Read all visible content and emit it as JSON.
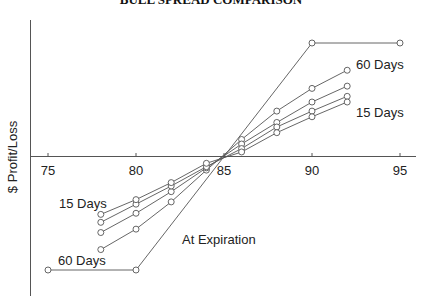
{
  "chart_data": {
    "type": "line",
    "title": "BULL SPREAD COMPARISON",
    "xlabel": "",
    "ylabel": "$ Profit/Loss",
    "xlim": [
      75,
      96
    ],
    "ylim": [
      -5.4,
      5.7
    ],
    "x_ticks": [
      75,
      80,
      85,
      90,
      95
    ],
    "y_ticks": [],
    "grid": false,
    "legend": "none (inline annotations)",
    "series": [
      {
        "name": "At Expiration",
        "x": [
          75,
          80,
          90,
          95
        ],
        "values": [
          -5,
          -5,
          5,
          5
        ]
      },
      {
        "name": "60 Days",
        "x": [
          78,
          80,
          82,
          84,
          86,
          88,
          90,
          92
        ],
        "values": [
          -4.1,
          -3.2,
          -2.0,
          -0.6,
          0.75,
          2.0,
          3.0,
          3.8
        ]
      },
      {
        "name": "",
        "x": [
          78,
          80,
          82,
          84,
          86,
          88,
          90,
          92
        ],
        "values": [
          -3.35,
          -2.5,
          -1.55,
          -0.5,
          0.55,
          1.5,
          2.4,
          3.1
        ]
      },
      {
        "name": "",
        "x": [
          78,
          80,
          82,
          84,
          86,
          88,
          90,
          92
        ],
        "values": [
          -2.9,
          -2.1,
          -1.3,
          -0.45,
          0.35,
          1.3,
          2.0,
          2.65
        ]
      },
      {
        "name": "15 Days",
        "x": [
          78,
          80,
          82,
          84,
          86,
          88,
          90,
          92
        ],
        "values": [
          -2.55,
          -1.9,
          -1.15,
          -0.3,
          0.2,
          1.05,
          1.75,
          2.4
        ]
      }
    ],
    "annotations": [
      {
        "text": "60 Days",
        "x": 356,
        "y": 69
      },
      {
        "text": "15 Days",
        "x": 356,
        "y": 117
      },
      {
        "text": "15 Days",
        "x": 59,
        "y": 208
      },
      {
        "text": "At Expiration",
        "x": 182,
        "y": 244
      },
      {
        "text": "60 Days",
        "x": 58,
        "y": 265
      }
    ]
  }
}
